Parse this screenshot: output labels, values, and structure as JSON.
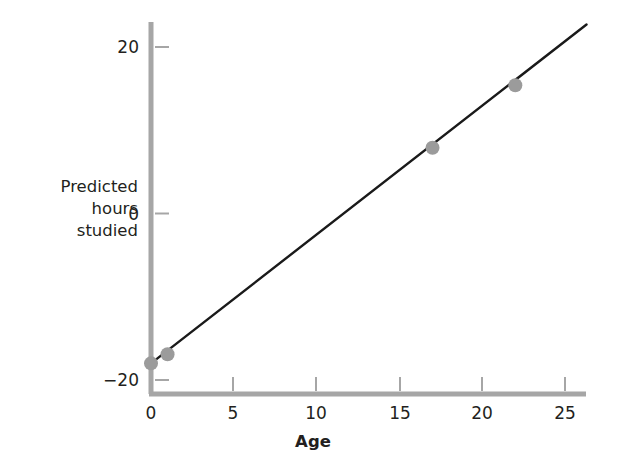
{
  "chart_data": {
    "type": "scatter",
    "title": "",
    "subtitle": "",
    "xlabel": "Age",
    "ylabel": "Predicted hours studied",
    "ylabel_lines": [
      "Predicted",
      "hours",
      "studied"
    ],
    "xlim": [
      0,
      26.3
    ],
    "ylim": [
      -20.6,
      22.7
    ],
    "xticks": [
      0,
      5,
      10,
      15,
      20,
      25
    ],
    "xticklabels": [
      "0",
      "5",
      "10",
      "15",
      "20",
      "25"
    ],
    "yticks": [
      20,
      0,
      -20
    ],
    "yticklabels": [
      "20",
      "0",
      "−20"
    ],
    "grid": false,
    "legend": false,
    "series": [
      {
        "name": "Regression line",
        "type": "line",
        "color": "#1a1a1a",
        "x": [
          0,
          26.3
        ],
        "y": [
          -18.0,
          22.7
        ]
      },
      {
        "name": "Predicted values",
        "type": "scatter",
        "color": "#9b9b9b",
        "points": [
          {
            "x": 0,
            "y": -18.0
          },
          {
            "x": 1,
            "y": -16.9
          },
          {
            "x": 17,
            "y": 7.9
          },
          {
            "x": 22,
            "y": 15.4
          }
        ]
      }
    ],
    "annotations": []
  },
  "axes": {
    "spine_color": "#a6a6a6",
    "tick_color": "#a6a6a6",
    "text_color": "#231f20"
  },
  "colors": {
    "background": "#ffffff",
    "line": "#1a1a1a",
    "marker": "#9b9b9b",
    "axis": "#a6a6a6"
  }
}
